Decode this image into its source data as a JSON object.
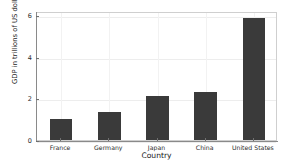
{
  "chart_data": {
    "type": "bar",
    "title": "",
    "subtitle": "",
    "xlabel": "Country",
    "ylabel": "GDP in trillions of US dollars",
    "categories": [
      "France",
      "Germany",
      "Japan",
      "China",
      "United States"
    ],
    "values": [
      1.0,
      1.35,
      2.1,
      2.3,
      5.85
    ],
    "series": [
      {
        "name": "GDP",
        "values": [
          1.0,
          1.35,
          2.1,
          2.3,
          5.85
        ]
      }
    ],
    "ylim": [
      0,
      6.2
    ],
    "yticks": [
      0,
      2,
      4,
      6
    ],
    "ytick_labels": [
      "0",
      "2",
      "4",
      "6"
    ],
    "xtick_labels": [
      "France",
      "Germany",
      "Japan",
      "China",
      "United States"
    ],
    "grid": true,
    "legend": false,
    "legend_position": "none",
    "bar_color": "#3a3a3a",
    "background_color": "#ffffff",
    "grid_color": "#ededed",
    "axis_color": "#8a8a8a"
  }
}
